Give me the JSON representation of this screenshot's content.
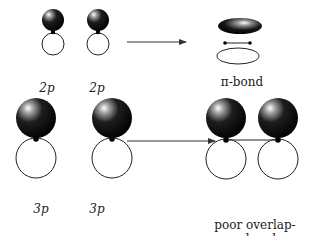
{
  "diagram": {
    "rows": [
      {
        "id": "2p",
        "left_labels": [
          "2p",
          "2p"
        ],
        "result_label": "π-bond"
      },
      {
        "id": "3p",
        "left_labels": [
          "3p",
          "3p"
        ],
        "result_label_line1": "poor overlap-",
        "result_label_line2": "π-bond"
      }
    ],
    "colors": {
      "lobe_filled": "#0a0a0a",
      "lobe_highlight": "#ffffff",
      "outline": "#222222",
      "arrow": "#333333",
      "text": "#1a1a1a"
    }
  }
}
